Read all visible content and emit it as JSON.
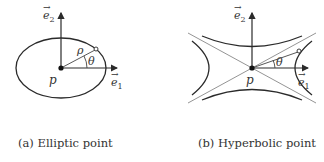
{
  "figures": [
    {
      "id": "a",
      "caption": "(a) Elliptic point",
      "labels": {
        "e1": "e⃗₁",
        "e2": "e⃗₂",
        "origin": "p",
        "radius": "ρ",
        "angle": "θ"
      }
    },
    {
      "id": "b",
      "caption": "(b) Hyperbolic point",
      "labels": {
        "e1": "e⃗₁",
        "e2": "e⃗₂",
        "origin": "p",
        "angle": "θ"
      }
    }
  ],
  "colors": {
    "stroke": "#2a2a2a",
    "thin": "#555555",
    "background": "#ffffff"
  }
}
